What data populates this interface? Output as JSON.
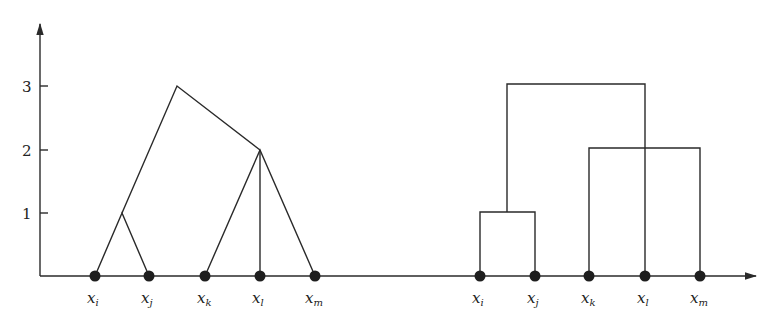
{
  "figure": {
    "y_axis": {
      "ticks": [
        {
          "label": "1",
          "y": 213
        },
        {
          "label": "2",
          "y": 150
        },
        {
          "label": "3",
          "y": 86
        }
      ]
    },
    "left_dendrogram": {
      "style": "slanted",
      "points": [
        {
          "base": "x",
          "sub": "i",
          "x": 95
        },
        {
          "base": "x",
          "sub": "j",
          "x": 149
        },
        {
          "base": "x",
          "sub": "k",
          "x": 205
        },
        {
          "base": "x",
          "sub": "l",
          "x": 260
        },
        {
          "base": "x",
          "sub": "m",
          "x": 315
        }
      ],
      "merges": [
        {
          "members": [
            "x_i",
            "x_j"
          ],
          "height": 1
        },
        {
          "members": [
            "x_k",
            "x_l",
            "x_m"
          ],
          "height": 2
        },
        {
          "members": [
            "{x_i,x_j}",
            "{x_k,x_l,x_m}"
          ],
          "height": 3
        }
      ]
    },
    "right_dendrogram": {
      "style": "rectangular",
      "points": [
        {
          "base": "x",
          "sub": "i",
          "x": 480
        },
        {
          "base": "x",
          "sub": "j",
          "x": 535
        },
        {
          "base": "x",
          "sub": "k",
          "x": 589
        },
        {
          "base": "x",
          "sub": "l",
          "x": 645
        },
        {
          "base": "x",
          "sub": "m",
          "x": 700
        }
      ],
      "merges": [
        {
          "members": [
            "x_i",
            "x_j"
          ],
          "height": 1
        },
        {
          "members": [
            "x_k",
            "x_m"
          ],
          "height": 2
        },
        {
          "members": [
            "{x_i,x_j}",
            "x_l"
          ],
          "height": 3
        }
      ]
    }
  }
}
